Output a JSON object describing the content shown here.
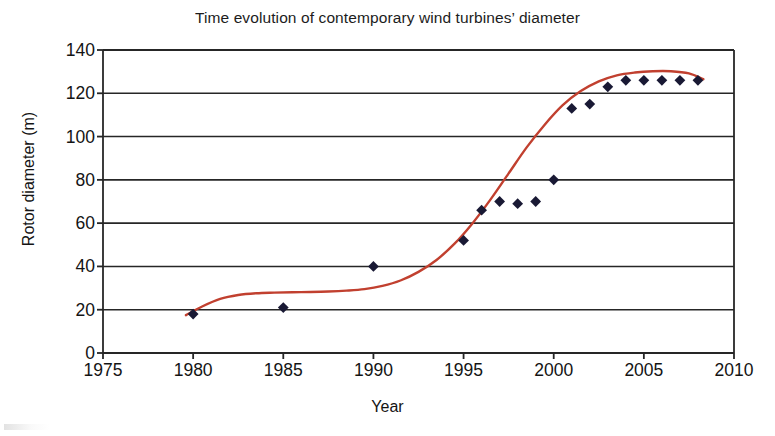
{
  "chart_data": {
    "type": "scatter",
    "title": "Time evolution of contemporary wind turbines’ diameter",
    "xlabel": "Year",
    "ylabel": "Rotor diameter (m)",
    "xlim": [
      1975,
      2010
    ],
    "ylim": [
      0,
      140
    ],
    "xticks": [
      1975,
      1980,
      1985,
      1990,
      1995,
      2000,
      2005,
      2010
    ],
    "yticks": [
      0,
      20,
      40,
      60,
      80,
      100,
      120,
      140
    ],
    "grid": "horizontal",
    "legend": "none",
    "marker_shape": "diamond",
    "marker_color": "#191934",
    "trendline_color": "#c1402f",
    "axis_color": "#262626",
    "background": "#ffffff",
    "series": [
      {
        "name": "Rotor diameter",
        "x": [
          1980,
          1985,
          1990,
          1995,
          1996,
          1997,
          1998,
          1999,
          2000,
          2001,
          2002,
          2003,
          2004,
          2005,
          2006,
          2007,
          2008
        ],
        "values": [
          18,
          21,
          40,
          52,
          66,
          70,
          69,
          70,
          80,
          113,
          115,
          123,
          126,
          126,
          126,
          126,
          126
        ]
      }
    ],
    "trendline": {
      "name": "S-curve fit",
      "x": [
        1979.6,
        1980.5,
        1981.5,
        1982.5,
        1983.5,
        1984.5,
        1985.5,
        1986.5,
        1987.5,
        1988.5,
        1989.5,
        1990.5,
        1991.5,
        1992.5,
        1993.5,
        1994.5,
        1995.5,
        1996.5,
        1997.5,
        1998.5,
        1999.5,
        2000.5,
        2001.5,
        2002.5,
        2003.5,
        2004.5,
        2005.5,
        2006.5,
        2007.5,
        2008.3
      ],
      "values": [
        17.5,
        21.5,
        25.0,
        26.8,
        27.6,
        27.9,
        28.1,
        28.2,
        28.4,
        28.8,
        29.5,
        31.0,
        33.5,
        37.5,
        43.0,
        50.5,
        60.0,
        71.0,
        83.0,
        95.0,
        105.5,
        114.5,
        121.0,
        125.5,
        128.3,
        129.6,
        130.2,
        130.2,
        129.2,
        126.5
      ]
    }
  }
}
